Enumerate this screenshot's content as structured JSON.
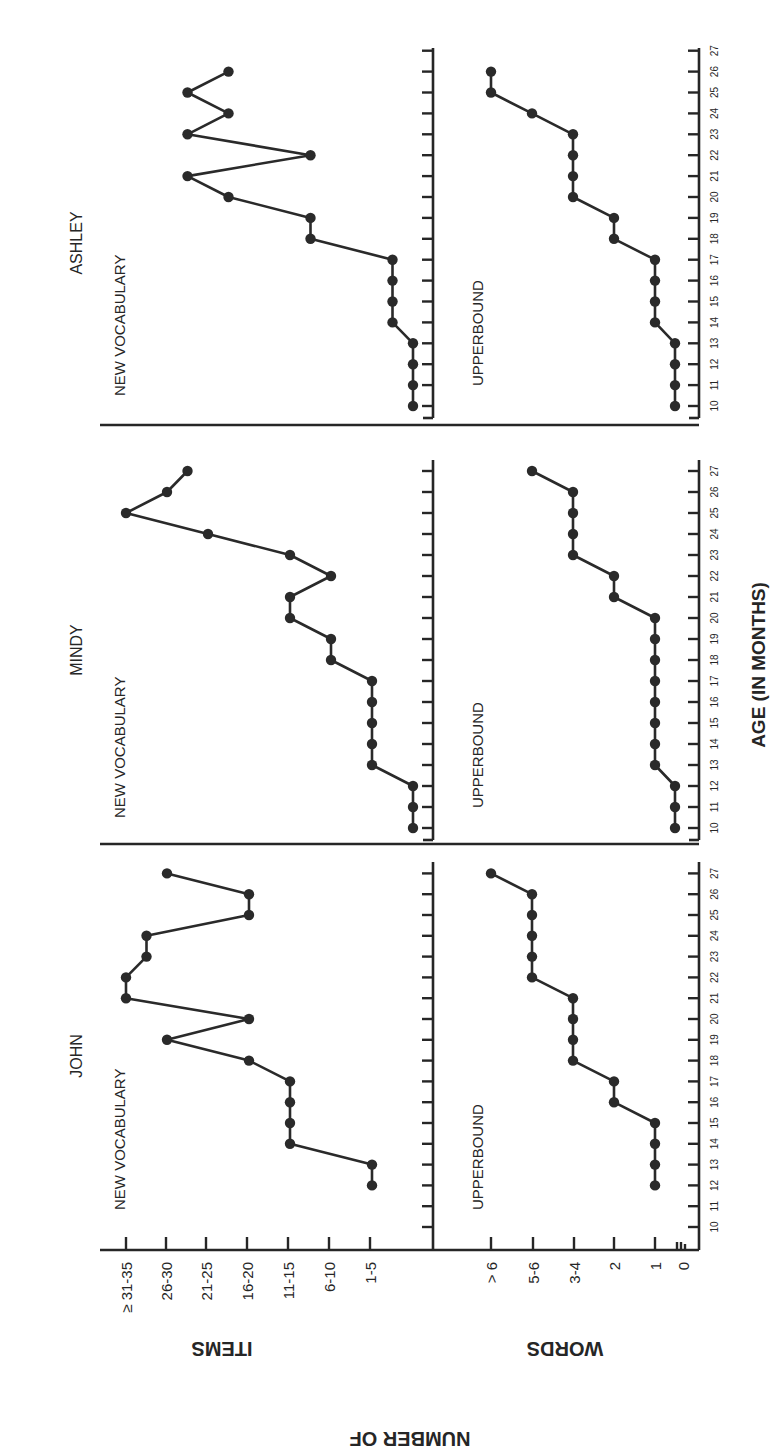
{
  "chart_data": {
    "type": "line",
    "orientation": "rotated 90 degrees counter-clockwise (ages run bottom-to-top, values increase to the left)",
    "xlabel": "AGE (IN MONTHS)",
    "ylabel_common": "NUMBER OF",
    "ylabel_items": "ITEMS",
    "ylabel_words": "WORDS",
    "x_ticks": [
      10,
      11,
      12,
      13,
      14,
      15,
      16,
      17,
      18,
      19,
      20,
      21,
      22,
      23,
      24,
      25,
      26,
      27
    ],
    "items_tick_labels": [
      "1-5",
      "6-10",
      "11-15",
      "16-20",
      "21-25",
      "26-30",
      "≥ 31-35"
    ],
    "words_tick_labels": [
      "0",
      "1",
      "2",
      "3-4",
      "5-6",
      "> 6"
    ],
    "value_encoding": "ordinal levels; items: 0=none,1=1-5,2=6-10,3=11-15,4=16-20,5=21-25,6=26-30,7=>=31-35; words: 0=0,1=1,2=2,3=3-4,4=5-6,5=>6",
    "panels": [
      {
        "child": "JOHN",
        "series": [
          {
            "name": "NEW VOCABULARY",
            "x": [
              12,
              13,
              14,
              15,
              16,
              17,
              18,
              19,
              20,
              21,
              22,
              23,
              24,
              25,
              26,
              27
            ],
            "values": [
              1,
              1,
              3,
              3,
              3,
              3,
              4,
              6,
              4,
              7,
              7,
              6.5,
              6.5,
              4,
              4,
              6
            ]
          },
          {
            "name": "UPPERBOUND",
            "x": [
              12,
              13,
              14,
              15,
              16,
              17,
              18,
              19,
              20,
              21,
              22,
              23,
              24,
              25,
              26,
              27
            ],
            "values": [
              1,
              1,
              1,
              1,
              2,
              2,
              3,
              3,
              3,
              3,
              4,
              4,
              4,
              4,
              4,
              5
            ]
          }
        ]
      },
      {
        "child": "MINDY",
        "series": [
          {
            "name": "NEW VOCABULARY",
            "x": [
              10,
              11,
              12,
              13,
              14,
              15,
              16,
              17,
              18,
              19,
              20,
              21,
              22,
              23,
              24,
              25,
              26,
              27
            ],
            "values": [
              0,
              0,
              0,
              1,
              1,
              1,
              1,
              1,
              2,
              2,
              3,
              3,
              2,
              3,
              5,
              7,
              6,
              5.5
            ]
          },
          {
            "name": "UPPERBOUND",
            "x": [
              10,
              11,
              12,
              13,
              14,
              15,
              16,
              17,
              18,
              19,
              20,
              21,
              22,
              23,
              24,
              25,
              26,
              27
            ],
            "values": [
              0,
              0,
              0,
              1,
              1,
              1,
              1,
              1,
              1,
              1,
              1,
              2,
              2,
              3,
              3,
              3,
              3,
              4
            ]
          }
        ]
      },
      {
        "child": "ASHLEY",
        "series": [
          {
            "name": "NEW VOCABULARY",
            "x": [
              10,
              11,
              12,
              13,
              14,
              15,
              16,
              17,
              18,
              19,
              20,
              21,
              22,
              23,
              24,
              25,
              26
            ],
            "values": [
              0,
              0,
              0,
              0,
              0.5,
              0.5,
              0.5,
              0.5,
              2.5,
              2.5,
              4.5,
              5.5,
              2.5,
              5.5,
              4.5,
              5.5,
              4.5
            ]
          },
          {
            "name": "UPPERBOUND",
            "x": [
              10,
              11,
              12,
              13,
              14,
              15,
              16,
              17,
              18,
              19,
              20,
              21,
              22,
              23,
              24,
              25,
              26
            ],
            "values": [
              0,
              0,
              0,
              0,
              1,
              1,
              1,
              1,
              2,
              2,
              3,
              3,
              3,
              3,
              4,
              5,
              5
            ]
          }
        ]
      }
    ],
    "grid": false,
    "legend": "none (series labeled inline)"
  },
  "labels": {
    "x_axis_title": "AGE (IN MONTHS)",
    "y_title_common": "NUMBER OF",
    "y_title_items": "ITEMS",
    "y_title_words": "WORDS",
    "series_items": "NEW VOCABULARY",
    "series_words": "UPPERBOUND",
    "children": [
      "ASHLEY",
      "MINDY",
      "JOHN"
    ]
  }
}
